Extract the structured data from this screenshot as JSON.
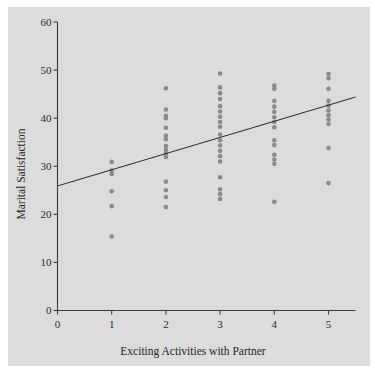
{
  "chart_data": {
    "type": "scatter",
    "title": "",
    "xlabel": "Exciting Activities with Partner",
    "ylabel": "Marital Satisfaction",
    "xlim": [
      0,
      5.5
    ],
    "ylim": [
      0,
      60
    ],
    "xticks": [
      0,
      1,
      2,
      3,
      4,
      5
    ],
    "yticks": [
      0,
      10,
      20,
      30,
      40,
      50,
      60
    ],
    "xtick_labels": [
      "0",
      "1",
      "2",
      "3",
      "4",
      "5"
    ],
    "ytick_labels": [
      "0",
      "10",
      "20",
      "30",
      "40",
      "50",
      "60"
    ],
    "grid": false,
    "legend": null,
    "marker": {
      "shape": "circle",
      "color": "#8a8a8a",
      "size_px": 4.6,
      "opacity": 1
    },
    "background_color": "#dcdcdc",
    "axis_color": "#3c3c3c",
    "points": [
      {
        "x": 1,
        "y": 30.9
      },
      {
        "x": 1,
        "y": 29.1
      },
      {
        "x": 1,
        "y": 28.4
      },
      {
        "x": 1,
        "y": 24.8
      },
      {
        "x": 1,
        "y": 21.7
      },
      {
        "x": 1,
        "y": 15.4
      },
      {
        "x": 2,
        "y": 46.2
      },
      {
        "x": 2,
        "y": 41.8
      },
      {
        "x": 2,
        "y": 40.5
      },
      {
        "x": 2,
        "y": 40.0
      },
      {
        "x": 2,
        "y": 38.0
      },
      {
        "x": 2,
        "y": 36.4
      },
      {
        "x": 2,
        "y": 35.6
      },
      {
        "x": 2,
        "y": 34.2
      },
      {
        "x": 2,
        "y": 33.4
      },
      {
        "x": 2,
        "y": 32.6
      },
      {
        "x": 2,
        "y": 31.9
      },
      {
        "x": 2,
        "y": 26.8
      },
      {
        "x": 2,
        "y": 25.0
      },
      {
        "x": 2,
        "y": 23.6
      },
      {
        "x": 2,
        "y": 21.5
      },
      {
        "x": 3,
        "y": 49.3
      },
      {
        "x": 3,
        "y": 46.4
      },
      {
        "x": 3,
        "y": 45.2
      },
      {
        "x": 3,
        "y": 44.0
      },
      {
        "x": 3,
        "y": 42.5
      },
      {
        "x": 3,
        "y": 41.4
      },
      {
        "x": 3,
        "y": 40.3
      },
      {
        "x": 3,
        "y": 39.2
      },
      {
        "x": 3,
        "y": 38.2
      },
      {
        "x": 3,
        "y": 36.6
      },
      {
        "x": 3,
        "y": 35.4
      },
      {
        "x": 3,
        "y": 34.3
      },
      {
        "x": 3,
        "y": 33.2
      },
      {
        "x": 3,
        "y": 32.1
      },
      {
        "x": 3,
        "y": 31.0
      },
      {
        "x": 3,
        "y": 27.7
      },
      {
        "x": 3,
        "y": 25.2
      },
      {
        "x": 3,
        "y": 24.2
      },
      {
        "x": 3,
        "y": 23.2
      },
      {
        "x": 4,
        "y": 46.8
      },
      {
        "x": 4,
        "y": 46.1
      },
      {
        "x": 4,
        "y": 43.6
      },
      {
        "x": 4,
        "y": 42.4
      },
      {
        "x": 4,
        "y": 41.3
      },
      {
        "x": 4,
        "y": 40.2
      },
      {
        "x": 4,
        "y": 39.2
      },
      {
        "x": 4,
        "y": 38.1
      },
      {
        "x": 4,
        "y": 35.4
      },
      {
        "x": 4,
        "y": 34.4
      },
      {
        "x": 4,
        "y": 32.4
      },
      {
        "x": 4,
        "y": 31.4
      },
      {
        "x": 4,
        "y": 30.5
      },
      {
        "x": 4,
        "y": 22.6
      },
      {
        "x": 5,
        "y": 49.2
      },
      {
        "x": 5,
        "y": 48.3
      },
      {
        "x": 5,
        "y": 46.1
      },
      {
        "x": 5,
        "y": 43.6
      },
      {
        "x": 5,
        "y": 42.6
      },
      {
        "x": 5,
        "y": 41.6
      },
      {
        "x": 5,
        "y": 40.6
      },
      {
        "x": 5,
        "y": 39.7
      },
      {
        "x": 5,
        "y": 38.8
      },
      {
        "x": 5,
        "y": 33.8
      },
      {
        "x": 5,
        "y": 26.5
      }
    ],
    "regression_line": {
      "x_start": 0.0,
      "y_start": 25.9,
      "x_end": 5.5,
      "y_end": 44.4,
      "color": "#2b2b2b",
      "width_px": 1
    }
  },
  "axis": {
    "x_ticks": [
      "0",
      "1",
      "2",
      "3",
      "4",
      "5"
    ],
    "y_ticks": [
      "0",
      "10",
      "20",
      "30",
      "40",
      "50",
      "60"
    ],
    "x_title": "Exciting Activities with Partner",
    "y_title": "Marital Satisfaction"
  }
}
